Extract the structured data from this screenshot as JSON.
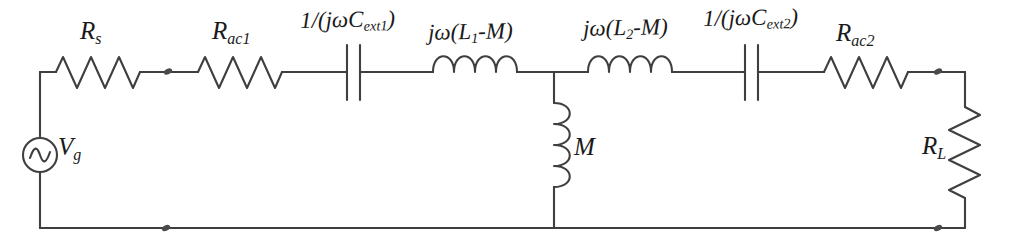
{
  "figure": {
    "type": "electrical-schematic",
    "background_color": "#ffffff",
    "line_color": "#3a3a3a",
    "label_color": "#1a1a1a"
  },
  "components": {
    "source": {
      "name": "voltage-source",
      "symbol": "ac-source",
      "label_main": "V",
      "label_sub": "g",
      "label_full": "Vg"
    },
    "rs": {
      "name": "resistor-source",
      "symbol": "resistor",
      "label_main": "R",
      "label_sub": "s",
      "label_full": "Rs"
    },
    "rac1": {
      "name": "resistor-ac1",
      "symbol": "resistor",
      "label_main": "R",
      "label_sub": "ac1",
      "label_full": "Rac1"
    },
    "cext1": {
      "name": "capacitor-ext1",
      "symbol": "capacitor",
      "label_prefix": "1/(j",
      "label_omega": "ω",
      "label_c": "C",
      "label_sub": "ext1",
      "label_suffix": ")",
      "label_full": "1/(jωCext1)"
    },
    "l1m": {
      "name": "inductor-l1-minus-m",
      "symbol": "inductor",
      "label_prefix": "j",
      "label_omega": "ω",
      "label_body_open": "(L",
      "label_sub": "1",
      "label_body_close": "-M)",
      "label_full": "jω(L1-M)"
    },
    "l2m": {
      "name": "inductor-l2-minus-m",
      "symbol": "inductor",
      "label_prefix": "j",
      "label_omega": "ω",
      "label_body_open": "(L",
      "label_sub": "2",
      "label_body_close": "-M)",
      "label_full": "jω(L2-M)"
    },
    "cext2": {
      "name": "capacitor-ext2",
      "symbol": "capacitor",
      "label_prefix": "1/(j",
      "label_omega": "ω",
      "label_c": "C",
      "label_sub": "ext2",
      "label_suffix": ")",
      "label_full": "1/(jωCext2)"
    },
    "rac2": {
      "name": "resistor-ac2",
      "symbol": "resistor",
      "label_main": "R",
      "label_sub": "ac2",
      "label_full": "Rac2"
    },
    "m": {
      "name": "inductor-mutual",
      "symbol": "inductor",
      "label_main": "M",
      "label_full": "M"
    },
    "rl": {
      "name": "resistor-load",
      "symbol": "resistor",
      "label_main": "R",
      "label_sub": "L",
      "label_full": "RL"
    }
  },
  "nodes": [
    {
      "name": "node-rs-rac1",
      "x": 168,
      "y": 72
    },
    {
      "name": "node-rac2-right",
      "x": 913,
      "y": 72
    },
    {
      "name": "node-bottom-left",
      "x": 166,
      "y": 228
    },
    {
      "name": "node-bottom-right",
      "x": 913,
      "y": 228
    }
  ]
}
